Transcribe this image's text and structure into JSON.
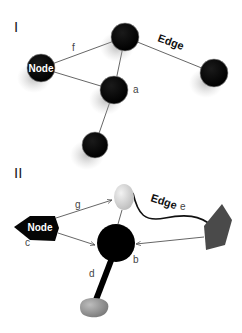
{
  "panel1": {
    "label": "I",
    "node_label": "Node",
    "edge_label": "Edge",
    "edge_f": "f",
    "node_a": "a"
  },
  "panel2": {
    "label": "II",
    "node_label": "Node",
    "edge_label": "Edge",
    "edge_g": "g",
    "edge_e": "e",
    "node_c": "c",
    "node_b": "b",
    "edge_d": "d"
  },
  "colors": {
    "node_black": "#050505",
    "edge_line": "#555555",
    "light_node": "#d8d8d8",
    "mid_node": "#8a8a8a",
    "dark_pentagon": "#4a4a4a"
  }
}
